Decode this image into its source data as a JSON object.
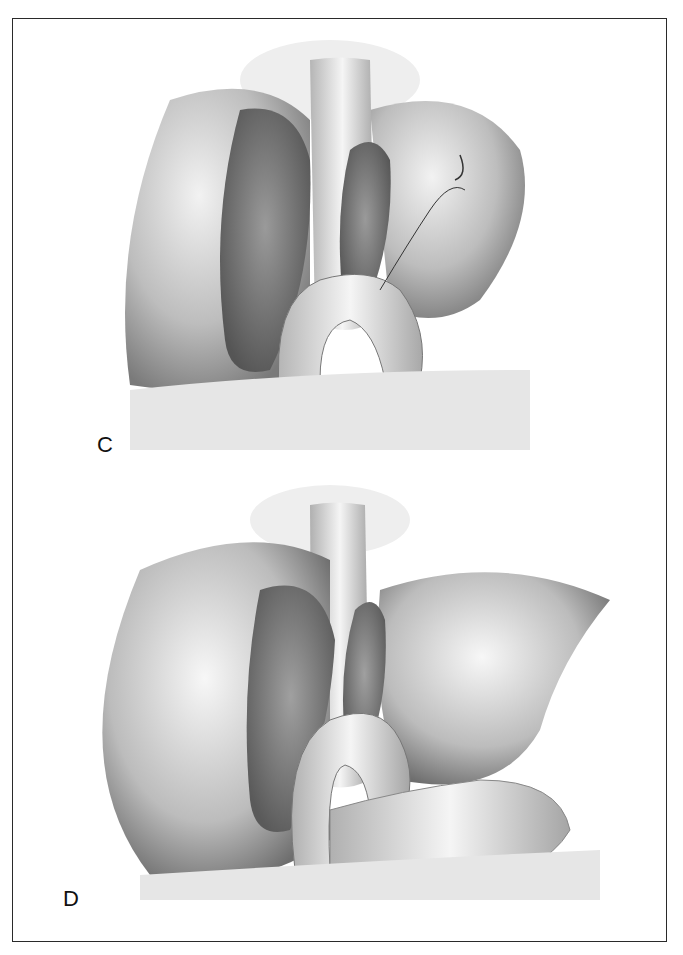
{
  "figure": {
    "panels": [
      {
        "label": "C",
        "description": "Surgical illustration: liver with sutured cut surface, stapled vessel stump and bowel loop anastomosis with suture needle"
      },
      {
        "label": "D",
        "description": "Surgical illustration: completed repair, liver lobes replaced over sutured surfaces and bowel loop"
      }
    ]
  },
  "colors": {
    "border": "#2a2a2a",
    "ink": "#111111",
    "background": "#ffffff"
  }
}
